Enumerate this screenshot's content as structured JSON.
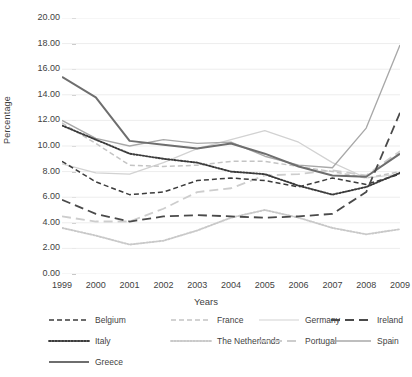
{
  "axis": {
    "ylabel": "Percentage",
    "xlabel": "Years",
    "yticks": [
      "0.00",
      "2.00",
      "4.00",
      "6.00",
      "8.00",
      "10.00",
      "12.00",
      "14.00",
      "16.00",
      "18.00",
      "20.00"
    ],
    "xticks": [
      "1999",
      "2000",
      "2001",
      "2002",
      "2003",
      "2004",
      "2005",
      "2006",
      "2007",
      "2008",
      "2009"
    ]
  },
  "legend": {
    "items": [
      {
        "label": "Belgium",
        "color": "#3c3c3c",
        "dash": "5,3",
        "width": 1.6
      },
      {
        "label": "France",
        "color": "#c4c4c4",
        "dash": "5,3",
        "width": 1.6
      },
      {
        "label": "Germany",
        "color": "#d2d2d2",
        "dash": "none",
        "width": 1.2
      },
      {
        "label": "Ireland",
        "color": "#4a4a4a",
        "dash": "9,5",
        "width": 1.8
      },
      {
        "label": "Italy",
        "color": "#3c3c3c",
        "dash": "1.6,1.6",
        "width": 1.8
      },
      {
        "label": "The Netherlands",
        "color": "#c9c9c9",
        "dash": "1.6,1.6",
        "width": 1.8
      },
      {
        "label": "Portugal",
        "color": "#cdcdcd",
        "dash": "9,5",
        "width": 1.8
      },
      {
        "label": "Spain",
        "color": "#a8a8a8",
        "dash": "none",
        "width": 1.4
      },
      {
        "label": "Greece",
        "color": "#6e6e6e",
        "dash": "none",
        "width": 2.0
      }
    ]
  },
  "chart_data": {
    "type": "line",
    "title": "",
    "xlabel": "Years",
    "ylabel": "Percentage",
    "ylim": [
      0,
      20
    ],
    "ytick_step": 2,
    "grid": true,
    "legend_position": "bottom",
    "categories": [
      "1999",
      "2000",
      "2001",
      "2002",
      "2003",
      "2004",
      "2005",
      "2006",
      "2007",
      "2008",
      "2009"
    ],
    "series": [
      {
        "name": "Belgium",
        "color": "#3c3c3c",
        "style": "dashed",
        "values": [
          8.8,
          7.2,
          6.2,
          6.4,
          7.3,
          7.5,
          7.3,
          6.8,
          7.5,
          7.0,
          7.8
        ]
      },
      {
        "name": "France",
        "color": "#c4c4c4",
        "style": "dashed",
        "values": [
          11.8,
          10.2,
          8.5,
          8.4,
          8.5,
          8.8,
          8.8,
          8.4,
          8.0,
          7.5,
          8.0
        ]
      },
      {
        "name": "Germany",
        "color": "#d2d2d2",
        "style": "solid",
        "values": [
          8.6,
          7.9,
          7.8,
          8.7,
          9.8,
          10.5,
          11.2,
          10.3,
          8.7,
          7.5,
          7.8
        ]
      },
      {
        "name": "Ireland",
        "color": "#4a4a4a",
        "style": "long-dash",
        "values": [
          5.8,
          4.7,
          4.1,
          4.5,
          4.6,
          4.5,
          4.4,
          4.5,
          4.7,
          6.4,
          12.6
        ]
      },
      {
        "name": "Italy",
        "color": "#3c3c3c",
        "style": "dotted",
        "values": [
          11.6,
          10.5,
          9.4,
          9.0,
          8.7,
          8.0,
          7.8,
          6.9,
          6.2,
          6.8,
          7.9
        ]
      },
      {
        "name": "The Netherlands",
        "color": "#c9c9c9",
        "style": "dotted",
        "values": [
          3.6,
          3.0,
          2.3,
          2.6,
          3.4,
          4.4,
          5.0,
          4.4,
          3.6,
          3.1,
          3.5
        ]
      },
      {
        "name": "Portugal",
        "color": "#cdcdcd",
        "style": "long-dash",
        "values": [
          4.5,
          4.1,
          4.1,
          5.1,
          6.4,
          6.7,
          7.7,
          7.8,
          8.1,
          7.7,
          9.6
        ]
      },
      {
        "name": "Spain",
        "color": "#a8a8a8",
        "style": "solid",
        "values": [
          12.0,
          10.6,
          10.0,
          10.5,
          10.2,
          10.3,
          9.2,
          8.5,
          8.3,
          11.4,
          17.9
        ]
      },
      {
        "name": "Greece",
        "color": "#6e6e6e",
        "style": "solid",
        "values": [
          15.4,
          13.8,
          10.4,
          10.1,
          9.8,
          10.2,
          9.4,
          8.4,
          7.7,
          7.6,
          9.4
        ]
      }
    ]
  }
}
